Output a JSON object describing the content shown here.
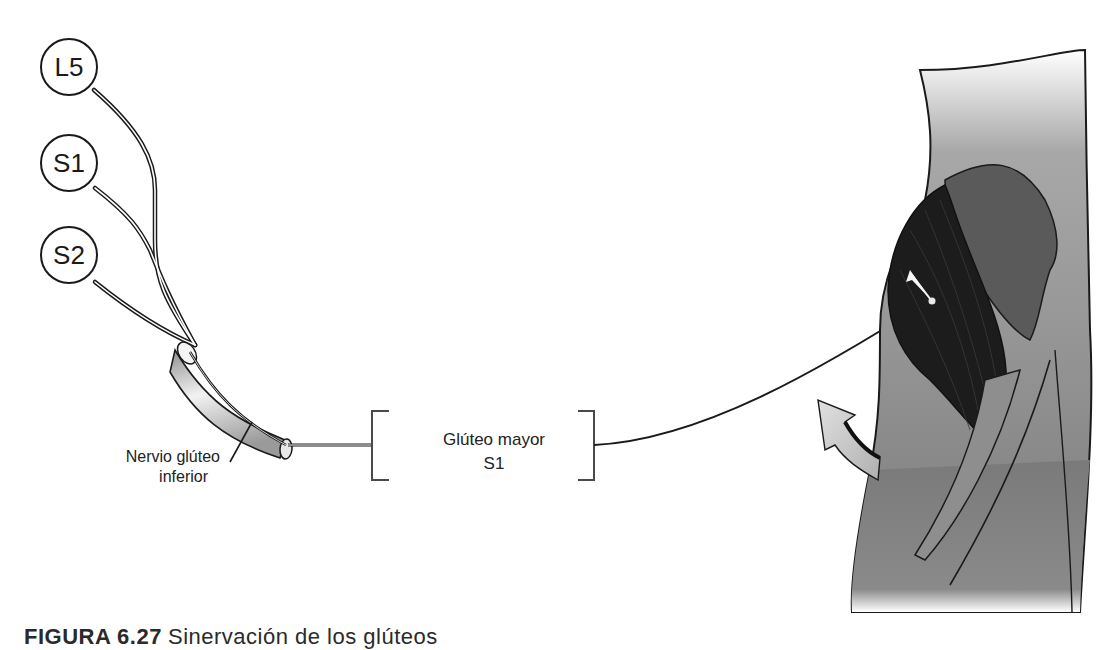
{
  "diagram": {
    "roots": [
      {
        "id": "L5",
        "label": "L5"
      },
      {
        "id": "S1",
        "label": "S1"
      },
      {
        "id": "S2",
        "label": "S2"
      }
    ],
    "nerve": {
      "label_line1": "Nervio glúteo",
      "label_line2": "inferior"
    },
    "muscle": {
      "name": "Glúteo mayor",
      "root": "S1"
    },
    "illustration": {
      "subject": "gluteus-maximus-hip-extension",
      "movement_arrow": "hip-extension-arrow"
    },
    "colors": {
      "line": "#1a1a1a",
      "nerve_tube": "#bdbdbd",
      "muscle_dark": "#1c1c1c",
      "skin": "#7a7a7a",
      "arrow_fill": "#c8c8c8"
    }
  },
  "caption": {
    "figure_number": "FIGURA 6.27",
    "text": "Sinervación de los glúteos"
  }
}
